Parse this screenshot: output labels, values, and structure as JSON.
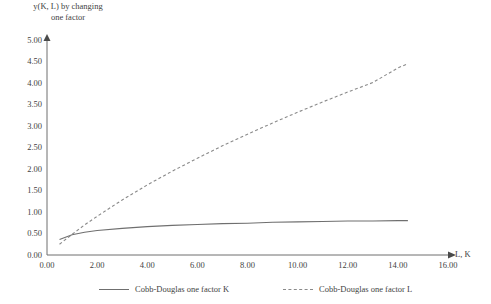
{
  "chart_data": {
    "type": "line",
    "title": "y(K, L) by changing\none factor",
    "xlabel": "L, K",
    "ylabel": "",
    "xlim": [
      0,
      16
    ],
    "ylim": [
      0,
      5
    ],
    "grid": false,
    "legend_position": "bottom",
    "x_ticks": [
      "0.00",
      "2.00",
      "4.00",
      "6.00",
      "8.00",
      "10.00",
      "12.00",
      "14.00",
      "16.00"
    ],
    "y_ticks": [
      "0.00",
      "0.50",
      "1.00",
      "1.50",
      "2.00",
      "2.50",
      "3.00",
      "3.50",
      "4.00",
      "4.50",
      "5.00"
    ],
    "series": [
      {
        "name": "Cobb-Douglas one factor K",
        "style": "solid",
        "color": "#6f6f6f",
        "x": [
          0.5,
          1.0,
          1.5,
          2.0,
          3.0,
          4.0,
          5.0,
          6.0,
          7.0,
          8.0,
          9.0,
          10.0,
          11.0,
          12.0,
          13.0,
          14.0,
          14.4
        ],
        "y": [
          0.36,
          0.47,
          0.53,
          0.57,
          0.62,
          0.66,
          0.69,
          0.71,
          0.73,
          0.74,
          0.76,
          0.77,
          0.78,
          0.79,
          0.79,
          0.8,
          0.8
        ]
      },
      {
        "name": "Cobb-Douglas one factor L",
        "style": "dashed",
        "color": "#8a8a8a",
        "x": [
          0.5,
          1.0,
          1.5,
          2.0,
          3.0,
          4.0,
          5.0,
          6.0,
          7.0,
          8.0,
          9.0,
          10.0,
          11.0,
          12.0,
          13.0,
          14.0,
          14.4
        ],
        "y": [
          0.25,
          0.48,
          0.7,
          0.9,
          1.28,
          1.63,
          1.95,
          2.25,
          2.54,
          2.81,
          3.07,
          3.32,
          3.56,
          3.79,
          4.01,
          4.35,
          4.45
        ]
      }
    ]
  },
  "axis": {
    "x_label": "L, K"
  }
}
